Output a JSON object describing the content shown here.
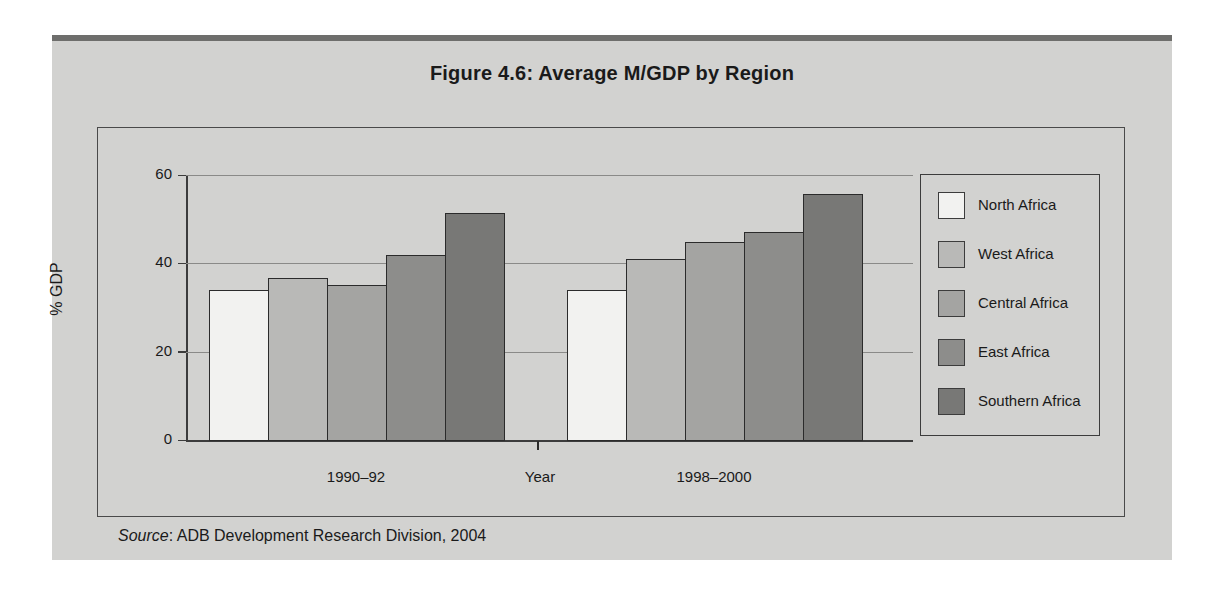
{
  "figure": {
    "title": "Figure 4.6:  Average M/GDP by Region",
    "source_prefix": "Source",
    "source_text": ": ADB Development Research Division, 2004"
  },
  "colors": {
    "page_background": "#ffffff",
    "panel_background": "#d2d2d0",
    "top_rule": "#6e6e6c",
    "axis": "#3c3c3c",
    "gridline": "#8a8a88",
    "bar_border": "#2b2b2b",
    "text": "#1a1a1a"
  },
  "chart_data": {
    "type": "bar",
    "title": "Figure 4.6:  Average M/GDP by Region",
    "xlabel": "Year",
    "ylabel": "% GDP",
    "categories": [
      "1990–92",
      "1998–2000"
    ],
    "ylim": [
      0,
      60
    ],
    "yticks": [
      0,
      20,
      40,
      60
    ],
    "ytick_labels": [
      "0",
      "20",
      "40",
      "60"
    ],
    "grid": true,
    "legend_position": "right",
    "series": [
      {
        "name": "North Africa",
        "color": "#f2f2f0",
        "values": [
          34.0,
          34.0
        ]
      },
      {
        "name": "West Africa",
        "color": "#b9b9b7",
        "values": [
          36.6,
          41.0
        ]
      },
      {
        "name": "Central Africa",
        "color": "#a4a4a2",
        "values": [
          35.2,
          44.9
        ]
      },
      {
        "name": "East Africa",
        "color": "#8d8d8b",
        "values": [
          41.9,
          47.2
        ]
      },
      {
        "name": "Southern Africa",
        "color": "#787876",
        "values": [
          51.4,
          55.6
        ]
      }
    ]
  }
}
